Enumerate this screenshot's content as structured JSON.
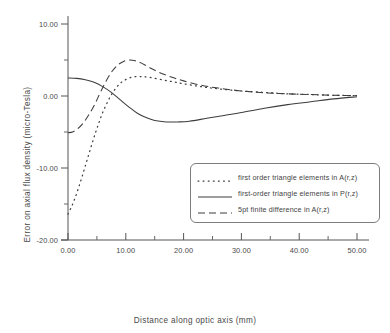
{
  "chart_data": {
    "type": "line",
    "title": "",
    "xlabel": "Distance along optic axis (mm)",
    "ylabel": "Error on axial flux density (micro-Tesla)",
    "xlim": [
      0,
      50
    ],
    "ylim": [
      -20,
      10
    ],
    "xticks": [
      "0.00",
      "10.00",
      "20.00",
      "30.00",
      "40.00",
      "50.00"
    ],
    "xtick_values": [
      0,
      10,
      20,
      30,
      40,
      50
    ],
    "yticks": [
      "10.00",
      "0.00",
      "-10.00",
      "-20.00"
    ],
    "ytick_values": [
      10,
      0,
      -10,
      -20
    ],
    "grid": false,
    "legend_position": "center-right",
    "series": [
      {
        "name": "first order triangle elements in A(r,z)",
        "style": "dotted",
        "x": [
          0.0,
          0.6,
          1.2,
          1.8,
          2.4,
          3.0,
          3.6,
          4.2,
          4.8,
          5.4,
          6.0,
          6.8,
          7.6,
          8.6,
          9.6,
          11.0,
          12.5,
          14.0,
          16.0,
          18.0,
          20.0,
          23.0,
          26.0,
          30.0,
          34.0,
          38.0,
          42.0,
          46.0,
          50.0
        ],
        "y": [
          -16.4,
          -15.4,
          -14.2,
          -12.8,
          -11.3,
          -9.7,
          -8.1,
          -6.5,
          -5.0,
          -3.6,
          -2.3,
          -0.9,
          0.3,
          1.4,
          2.1,
          2.6,
          2.7,
          2.6,
          2.3,
          2.0,
          1.7,
          1.3,
          1.0,
          0.7,
          0.5,
          0.3,
          0.2,
          0.1,
          0.05
        ]
      },
      {
        "name": "first-order triangle elements in P(r,z)",
        "style": "solid",
        "x": [
          0.0,
          1.5,
          3.0,
          4.5,
          6.0,
          7.5,
          9.0,
          10.5,
          12.0,
          13.5,
          15.0,
          17.0,
          19.0,
          21.0,
          24.0,
          27.0,
          30.0,
          34.0,
          38.0,
          42.0,
          46.0,
          50.0
        ],
        "y": [
          2.5,
          2.45,
          2.25,
          1.9,
          1.3,
          0.5,
          -0.5,
          -1.5,
          -2.4,
          -3.0,
          -3.4,
          -3.6,
          -3.6,
          -3.5,
          -3.1,
          -2.7,
          -2.3,
          -1.7,
          -1.2,
          -0.8,
          -0.4,
          -0.1
        ]
      },
      {
        "name": "5pt finite difference in A(r,z)",
        "style": "dashed",
        "x": [
          0.0,
          0.8,
          1.6,
          2.6,
          3.6,
          4.6,
          5.6,
          6.6,
          7.6,
          8.6,
          9.6,
          10.6,
          11.6,
          12.6,
          14.0,
          16.0,
          18.0,
          20.0,
          23.0,
          26.0,
          30.0,
          34.0,
          38.0,
          42.0,
          46.0,
          50.0
        ],
        "y": [
          -5.1,
          -5.0,
          -4.6,
          -3.8,
          -2.6,
          -1.2,
          0.5,
          2.1,
          3.4,
          4.3,
          4.8,
          5.0,
          4.9,
          4.6,
          4.0,
          3.2,
          2.6,
          2.1,
          1.5,
          1.1,
          0.7,
          0.45,
          0.3,
          0.2,
          0.1,
          0.05
        ]
      }
    ]
  },
  "legend": {
    "entries": [
      {
        "label": "first order triangle elements in A(r,z)",
        "style": "dotted"
      },
      {
        "label": "first-order triangle elements in P(r,z)",
        "style": "solid"
      },
      {
        "label": "5pt finite difference in A(r,z)",
        "style": "dashed"
      }
    ]
  },
  "colors": {
    "axis": "#555555",
    "curve": "#3d3d3d",
    "text": "#4a4a4a",
    "background": "#ffffff",
    "legend_border": "#7d7d7d"
  }
}
